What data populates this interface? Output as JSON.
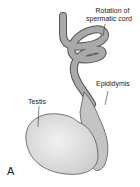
{
  "diagram": {
    "labels": {
      "cord_line1": "Rotation of",
      "cord_line2": "spermatic cord",
      "epididymis": "Epididymis",
      "testis": "Testis"
    },
    "panel_letter": "A",
    "colors": {
      "cord_fill": "#a9a9a9",
      "cord_stroke": "#555555",
      "testis_fill": "#e2e2e2",
      "epididymis_fill": "#c4c4c4"
    }
  }
}
